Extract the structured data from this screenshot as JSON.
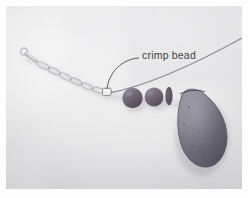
{
  "figure": {
    "kind": "photograph",
    "background_description": "white cloth"
  },
  "annotations": [
    {
      "id": "crimp-bead",
      "label": "crimp bead",
      "label_x": 136,
      "label_y": 43,
      "leader": "curved arc from label left edge down to the crimp tube on the wire",
      "leader_start": [
        133,
        52
      ],
      "leader_end": [
        101,
        86
      ]
    }
  ],
  "components": {
    "clasp": {
      "name": "lobster-clasp",
      "color": "#b9b9bc",
      "x": 14,
      "y": 44
    },
    "chain": {
      "name": "oval-link-chain",
      "color": "#bdbdc0",
      "links": 7,
      "from": [
        18,
        48
      ],
      "to": [
        96,
        86
      ]
    },
    "crimp_bead": {
      "name": "crimp-tube",
      "color": "#9a9a9e",
      "x": 98,
      "y": 83,
      "width": 9,
      "height": 8
    },
    "wire": {
      "name": "beading-wire",
      "color": "#8d8d92",
      "from": [
        104,
        87
      ],
      "to": [
        248,
        38
      ]
    },
    "round_beads": [
      {
        "name": "round-bead-1",
        "color": "#6d6470",
        "cx": 126,
        "cy": 92,
        "r": 10
      },
      {
        "name": "round-bead-2",
        "color": "#6f6672",
        "cx": 148,
        "cy": 91,
        "r": 9
      }
    ],
    "spacer_bead": {
      "name": "disc-spacer-bead",
      "color": "#5f5763",
      "cx": 163,
      "cy": 90,
      "rx": 3.5,
      "ry": 9
    },
    "pendant": {
      "name": "teardrop-pendant",
      "shape": "briolette",
      "color": "#6d6b77",
      "highlight": "#8b8995",
      "shadow": "#4f4d59",
      "cx": 192,
      "cy": 125,
      "width": 52,
      "height": 74
    }
  },
  "palette": {
    "page_background": "#ffffff",
    "photo_border": "#f2f2f3",
    "cloth_light": "#f4f4f5",
    "cloth_mid": "#e6e6e8",
    "cloth_dark": "#d5d5d9",
    "metal": "#bdbdc0",
    "bead_dark": "#6d6470",
    "pendant_body": "#6d6b77",
    "label_ink": "#3f3f42"
  }
}
